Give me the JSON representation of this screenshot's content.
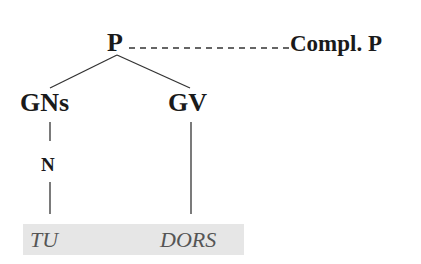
{
  "diagram": {
    "type": "syntax-tree",
    "nodes": {
      "root": "P",
      "complement": "Compl. P",
      "left_branch": "GNs",
      "right_branch": "GV",
      "left_child": "N"
    },
    "words": [
      "TU",
      "DORS"
    ],
    "colors": {
      "text": "#1a1a1a",
      "lines": "#333333",
      "word_text": "#555555",
      "word_band": "#e6e6e6"
    }
  }
}
